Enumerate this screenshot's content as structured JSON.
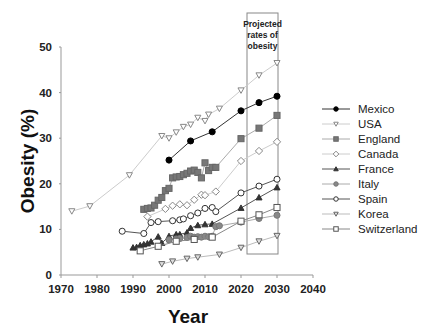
{
  "chart_data": {
    "type": "line",
    "title": "",
    "xlabel": "Year",
    "ylabel": "Obesity (%)",
    "xlim": [
      1970,
      2040
    ],
    "ylim": [
      0,
      50
    ],
    "xticks": [
      1970,
      1980,
      1990,
      2000,
      2010,
      2020,
      2030,
      2040
    ],
    "yticks": [
      0,
      10,
      20,
      30,
      40,
      50
    ],
    "grid": false,
    "legend_position": "right",
    "annotations": [
      {
        "text": "Projected rates of obesity",
        "type": "box",
        "x_range": [
          2020,
          2030
        ],
        "note": "Box highlights projected values for 2020–2030"
      }
    ],
    "series": [
      {
        "name": "Mexico",
        "marker": "filled-circle",
        "color": "#000000",
        "line_color": "#333333",
        "x": [
          2000,
          2006,
          2012,
          2020,
          2025,
          2030
        ],
        "values": [
          25.2,
          29.4,
          31.4,
          36.0,
          37.8,
          39.2
        ]
      },
      {
        "name": "USA",
        "marker": "open-triangle-down",
        "color": "#888888",
        "line_color": "#cccccc",
        "x": [
          1973,
          1978,
          1989,
          1998,
          2000,
          2002,
          2004,
          2006,
          2008,
          2010,
          2011,
          2014,
          2020,
          2025,
          2030
        ],
        "values": [
          14.0,
          15.1,
          21.9,
          30.5,
          30.0,
          31.3,
          32.5,
          33.0,
          34.5,
          33.8,
          35.2,
          36.5,
          40.5,
          43.8,
          46.5
        ]
      },
      {
        "name": "England",
        "marker": "filled-square",
        "color": "#777777",
        "line_color": "#aaaaaa",
        "x": [
          1993,
          1994,
          1995,
          1996,
          1997,
          1998,
          1999,
          2000,
          2001,
          2002,
          2003,
          2004,
          2005,
          2006,
          2007,
          2008,
          2009,
          2010,
          2011,
          2012,
          2013,
          2020,
          2025,
          2030
        ],
        "values": [
          14.4,
          14.6,
          14.7,
          15.3,
          16.4,
          17.0,
          18.5,
          19.0,
          21.3,
          21.5,
          21.6,
          22.0,
          22.3,
          22.8,
          23.0,
          22.5,
          21.3,
          24.6,
          22.9,
          23.6,
          23.6,
          29.9,
          32.2,
          35.0
        ]
      },
      {
        "name": "Canada",
        "marker": "open-diamond",
        "color": "#888888",
        "line_color": "#cccccc",
        "x": [
          1994,
          1999,
          2001,
          2003,
          2005,
          2007,
          2009,
          2010,
          2013,
          2020,
          2025,
          2030
        ],
        "values": [
          12.8,
          14.5,
          15.2,
          15.5,
          15.3,
          16.5,
          17.6,
          17.5,
          18.3,
          25.0,
          27.2,
          29.2
        ]
      },
      {
        "name": "France",
        "marker": "filled-triangle",
        "color": "#333333",
        "line_color": "#555555",
        "x": [
          1990,
          1991,
          1992,
          1993,
          1994,
          1995,
          1997,
          1998,
          2000,
          2002,
          2003,
          2005,
          2006,
          2008,
          2010,
          2012,
          2020,
          2025,
          2030
        ],
        "values": [
          6.0,
          6.1,
          6.5,
          6.7,
          6.9,
          7.3,
          8.4,
          7.0,
          8.5,
          8.9,
          8.9,
          9.3,
          10.3,
          10.9,
          11.1,
          11.2,
          14.7,
          17.0,
          19.2
        ]
      },
      {
        "name": "Italy",
        "marker": "filled-circle-grey",
        "color": "#888888",
        "line_color": "#aaaaaa",
        "x": [
          2000,
          2002,
          2003,
          2005,
          2006,
          2007,
          2008,
          2009,
          2010,
          2011,
          2012,
          2013,
          2014,
          2020,
          2025,
          2030
        ],
        "values": [
          7.7,
          7.9,
          8.0,
          8.2,
          8.5,
          8.3,
          8.4,
          8.3,
          8.5,
          8.4,
          8.5,
          10.6,
          10.8,
          11.6,
          12.4,
          13.1
        ]
      },
      {
        "name": "Spain",
        "marker": "open-circle",
        "color": "#333333",
        "line_color": "#555555",
        "x": [
          1987,
          1993,
          1995,
          1997,
          2001,
          2003,
          2004,
          2006,
          2008,
          2010,
          2012,
          2013,
          2020,
          2025,
          2030
        ],
        "values": [
          9.6,
          9.1,
          11.5,
          11.7,
          11.9,
          12.1,
          12.3,
          13.0,
          13.6,
          14.6,
          14.8,
          13.9,
          18.0,
          19.5,
          21.0
        ]
      },
      {
        "name": "Korea",
        "marker": "open-triangle-down-grey",
        "color": "#777777",
        "line_color": "#bbbbbb",
        "x": [
          1998,
          2001,
          2005,
          2008,
          2014,
          2020,
          2025,
          2030
        ],
        "values": [
          2.4,
          3.0,
          3.6,
          3.9,
          4.5,
          6.0,
          7.4,
          8.6
        ]
      },
      {
        "name": "Switzerland",
        "marker": "open-square",
        "color": "#555555",
        "line_color": "#888888",
        "x": [
          1992,
          1997,
          2002,
          2007,
          2012,
          2020,
          2025,
          2030
        ],
        "values": [
          5.3,
          6.3,
          7.4,
          7.8,
          8.3,
          11.8,
          13.2,
          14.8
        ]
      }
    ]
  },
  "labels": {
    "ylabel": "Obesity (%)",
    "xlabel": "Year",
    "projected_box": [
      "Projected",
      "rates of",
      "obesity"
    ]
  },
  "legend": {
    "items": [
      "Mexico",
      "USA",
      "England",
      "Canada",
      "France",
      "Italy",
      "Spain",
      "Korea",
      "Switzerland"
    ]
  }
}
